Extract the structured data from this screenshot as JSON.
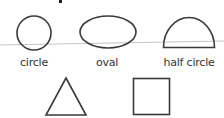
{
  "diagram": {
    "stroke_color": "#3a3a3a",
    "line_color": "#bdbdbd",
    "shapes": [
      {
        "name": "circle",
        "label": "circle"
      },
      {
        "name": "oval",
        "label": "oval"
      },
      {
        "name": "half-circle",
        "label": "half circle"
      },
      {
        "name": "triangle",
        "label": ""
      },
      {
        "name": "square",
        "label": ""
      }
    ]
  }
}
